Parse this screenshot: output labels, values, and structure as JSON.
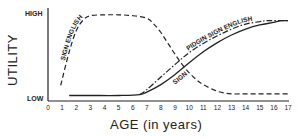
{
  "chart_data": {
    "type": "line",
    "title": "",
    "xlabel": "AGE (in years)",
    "ylabel": "UTILITY",
    "x_ticks": [
      "0",
      "1",
      "2",
      "3",
      "4",
      "5",
      "6",
      "7",
      "8",
      "9",
      "10",
      "11",
      "12",
      "13",
      "14",
      "15",
      "16",
      "17"
    ],
    "y_ticks": [
      "LOW",
      "HIGH"
    ],
    "xlim": [
      0,
      17
    ],
    "ylim": [
      0,
      1
    ],
    "grid": false,
    "legend": "inline curve labels",
    "series": [
      {
        "name": "SIGN ENGLISH",
        "style": "dashed",
        "x": [
          0.9,
          1.5,
          2.0,
          2.5,
          3.0,
          4.0,
          5.0,
          6.0,
          7.0,
          7.5,
          8.0,
          8.5,
          9.0,
          9.5,
          10.0,
          10.5,
          11.0,
          12.0,
          13.0,
          14.0,
          15.0,
          16.0,
          17.0
        ],
        "y": [
          0.15,
          0.55,
          0.8,
          0.93,
          0.98,
          0.99,
          0.99,
          0.98,
          0.95,
          0.88,
          0.78,
          0.65,
          0.52,
          0.4,
          0.3,
          0.22,
          0.16,
          0.08,
          0.05,
          0.05,
          0.05,
          0.05,
          0.05
        ]
      },
      {
        "name": "PIDGIN SIGN ENGLISH",
        "style": "dash-dot",
        "x": [
          6.5,
          7.0,
          8.0,
          9.0,
          10.0,
          11.0,
          12.0,
          13.0,
          14.0,
          15.0,
          15.5,
          16.0,
          17.0
        ],
        "y": [
          0.04,
          0.1,
          0.25,
          0.4,
          0.54,
          0.65,
          0.74,
          0.82,
          0.88,
          0.91,
          0.92,
          0.92,
          0.92
        ]
      },
      {
        "name": "SIGN",
        "style": "solid",
        "x": [
          1.5,
          3.0,
          5.0,
          6.5,
          7.0,
          8.0,
          9.0,
          10.0,
          11.0,
          12.0,
          13.0,
          14.0,
          15.0,
          16.0,
          16.5,
          17.0
        ],
        "y": [
          0.03,
          0.03,
          0.03,
          0.04,
          0.07,
          0.16,
          0.28,
          0.42,
          0.55,
          0.66,
          0.75,
          0.82,
          0.87,
          0.9,
          0.92,
          0.92
        ]
      }
    ]
  },
  "axes": {
    "y_title": "UTILITY",
    "y_high": "HIGH",
    "y_low": "LOW",
    "x_title": "AGE (in years)"
  },
  "colors": {
    "ink": "#222222",
    "background": "#ffffff"
  }
}
